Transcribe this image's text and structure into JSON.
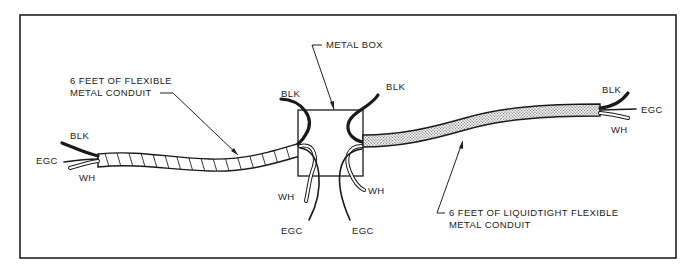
{
  "diagram": {
    "colors": {
      "line": "#1a1a1a",
      "background": "#ffffff",
      "border": "#222222"
    },
    "labels": {
      "metal_box": "METAL BOX",
      "fmc_line1": "6 FEET OF FLEXIBLE",
      "fmc_line2": "METAL CONDUIT",
      "lfmc_line1": "6 FEET OF LIQUIDTIGHT FLEXIBLE",
      "lfmc_line2": "METAL CONDUIT"
    },
    "left_end": {
      "blk": "BLK",
      "egc": "EGC",
      "wh": "WH"
    },
    "box_left": {
      "blk": "BLK",
      "wh": "WH",
      "egc": "EGC"
    },
    "box_right": {
      "blk": "BLK",
      "wh": "WH",
      "egc": "EGC"
    },
    "right_end": {
      "blk": "BLK",
      "egc": "EGC",
      "wh": "WH"
    }
  }
}
